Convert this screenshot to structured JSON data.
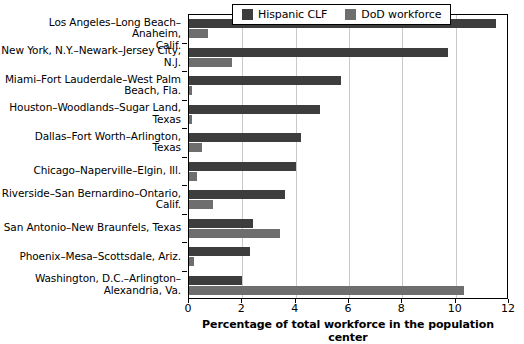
{
  "chart_data": {
    "type": "bar",
    "orientation": "horizontal",
    "title": "",
    "xlabel": "Percentage of total workforce in the population center",
    "ylabel": "",
    "xlim": [
      0,
      12
    ],
    "xticks": [
      0,
      2,
      4,
      6,
      8,
      10,
      12
    ],
    "grid": true,
    "legend_position": "top-center",
    "categories": [
      "Los Angeles–Long Beach–Anaheim, Calif.",
      "New York, N.Y.–Newark–Jersey City, N.J.",
      "Miami–Fort Lauderdale–West Palm Beach, Fla.",
      "Houston–Woodlands–Sugar Land, Texas",
      "Dallas–Fort Worth–Arlington, Texas",
      "Chicago–Naperville–Elgin, Ill.",
      "Riverside–San Bernardino–Ontario, Calif.",
      "San Antonio–New Braunfels, Texas",
      "Phoenix–Mesa–Scottsdale, Ariz.",
      "Washington, D.C.–Arlington–Alexandria, Va."
    ],
    "series": [
      {
        "name": "Hispanic CLF",
        "color": "#3d3d3d",
        "values": [
          11.5,
          9.7,
          5.7,
          4.9,
          4.2,
          4.0,
          3.6,
          2.4,
          2.3,
          2.0
        ]
      },
      {
        "name": "DoD workforce",
        "color": "#6e6e6e",
        "values": [
          0.7,
          1.6,
          0.1,
          0.1,
          0.5,
          0.3,
          0.9,
          3.4,
          0.2,
          10.3
        ]
      }
    ]
  },
  "legend": {
    "items": [
      {
        "label": "Hispanic CLF",
        "color": "#3d3d3d"
      },
      {
        "label": "DoD workforce",
        "color": "#6e6e6e"
      }
    ]
  },
  "axis": {
    "x_title": "Percentage of total workforce in the population center",
    "tick_labels": [
      "0",
      "2",
      "4",
      "6",
      "8",
      "10",
      "12"
    ]
  },
  "category_labels": [
    {
      "line1": "Los Angeles–Long Beach–Anaheim,",
      "line2": "Calif."
    },
    {
      "line1": "New York, N.Y.–Newark–Jersey City,",
      "line2": "N.J."
    },
    {
      "line1": "Miami–Fort Lauderdale–West Palm",
      "line2": "Beach, Fla."
    },
    {
      "line1": "Houston–Woodlands–Sugar Land,",
      "line2": "Texas"
    },
    {
      "line1": "Dallas–Fort Worth–Arlington,",
      "line2": "Texas"
    },
    {
      "line1": "Chicago–Naperville–Elgin, Ill.",
      "line2": ""
    },
    {
      "line1": "Riverside–San Bernardino–Ontario,",
      "line2": "Calif."
    },
    {
      "line1": "San Antonio–New Braunfels, Texas",
      "line2": ""
    },
    {
      "line1": "Phoenix–Mesa–Scottsdale, Ariz.",
      "line2": ""
    },
    {
      "line1": "Washington, D.C.–Arlington–",
      "line2": "Alexandria, Va."
    }
  ]
}
